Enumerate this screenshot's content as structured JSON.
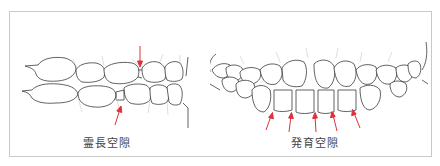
{
  "figure": {
    "panels": [
      {
        "id": "primate-space",
        "caption": "霊長空隙",
        "arrows": 2,
        "arrow_color": "#e0303a"
      },
      {
        "id": "developmental-space",
        "caption": "発育空隙",
        "arrows": 5,
        "arrow_color": "#e0303a"
      }
    ],
    "line_color": "#3a3a3a",
    "border_color": "#c9c9c9"
  }
}
